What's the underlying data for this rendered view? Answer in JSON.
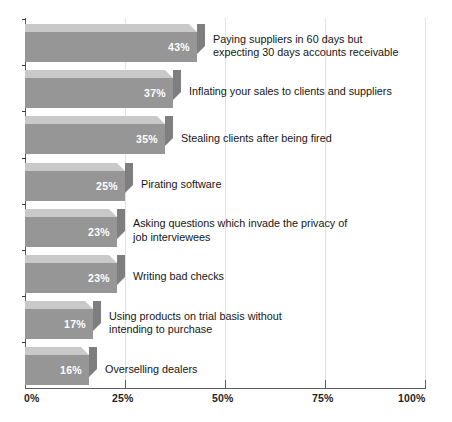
{
  "chart_data": {
    "type": "bar",
    "orientation": "horizontal",
    "title": "",
    "subtitle": "",
    "xlabel": "",
    "ylabel": "",
    "xlim": [
      0,
      100
    ],
    "xticks": [
      0,
      25,
      50,
      75,
      100
    ],
    "xtick_labels": [
      "0%",
      "25%",
      "50%",
      "75%",
      "100%"
    ],
    "grid": true,
    "grid_axis": "x",
    "legend": false,
    "value_label_suffix": "%",
    "value_label_position": "inside-end",
    "style": "3d-shaded-bars",
    "colors": {
      "bar_front": "#969696",
      "bar_top": "#c9c9c9",
      "bar_side": "#7e7e7e",
      "value_text": "#ffffff",
      "label_text": "#161616",
      "axis": "#5d5d5d",
      "gridline": "#e2e2e2",
      "background": "#ffffff"
    },
    "categories": [
      "Paying suppliers in 60 days but\nexpecting 30 days accounts receivable",
      "Inflating your sales to clients and suppliers",
      "Stealing clients after being fired",
      "Pirating software",
      "Asking questions which invade the privacy of\njob interviewees",
      "Writing bad checks",
      "Using products on trial basis without\nintending to purchase",
      "Overselling dealers"
    ],
    "values": [
      43,
      37,
      35,
      25,
      23,
      23,
      17,
      16
    ],
    "value_labels": [
      "43%",
      "37%",
      "35%",
      "25%",
      "23%",
      "23%",
      "17%",
      "16%"
    ],
    "bars": [
      {
        "label": "Paying suppliers in 60 days but\nexpecting 30 days accounts receivable",
        "value": 43,
        "value_label": "43%"
      },
      {
        "label": "Inflating your sales to clients and suppliers",
        "value": 37,
        "value_label": "37%"
      },
      {
        "label": "Stealing clients after being fired",
        "value": 35,
        "value_label": "35%"
      },
      {
        "label": "Pirating software",
        "value": 25,
        "value_label": "25%"
      },
      {
        "label": "Asking questions which invade the privacy of\njob interviewees",
        "value": 23,
        "value_label": "23%"
      },
      {
        "label": "Writing bad checks",
        "value": 23,
        "value_label": "23%"
      },
      {
        "label": "Using products on trial basis without\nintending to purchase",
        "value": 17,
        "value_label": "17%"
      },
      {
        "label": "Overselling dealers",
        "value": 16,
        "value_label": "16%"
      }
    ]
  }
}
